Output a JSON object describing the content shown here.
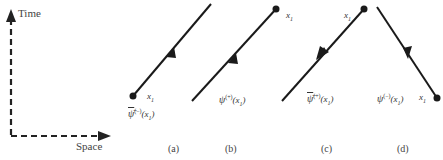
{
  "axes": {
    "time_label": "Time",
    "space_label": "Space",
    "style": "dashed"
  },
  "panels": [
    {
      "id": "a",
      "caption": "(a)",
      "point_label": "x1",
      "field_symbol": "ψ̄",
      "field_superscript": "(−)",
      "field_argument": "(x1)",
      "direction": "up-right",
      "arrow": "forward",
      "dot_position": "bottom"
    },
    {
      "id": "b",
      "caption": "(b)",
      "point_label": "x1",
      "field_symbol": "ψ",
      "field_superscript": "(+)",
      "field_argument": "(x1)",
      "direction": "up-right",
      "arrow": "forward",
      "dot_position": "top"
    },
    {
      "id": "c",
      "caption": "(c)",
      "point_label": "x1",
      "field_symbol": "ψ̄",
      "field_superscript": "(+)",
      "field_argument": "(x1)",
      "direction": "down-left",
      "arrow": "backward",
      "dot_position": "top"
    },
    {
      "id": "d",
      "caption": "(d)",
      "point_label": "x1",
      "field_symbol": "ψ",
      "field_superscript": "(−)",
      "field_argument": "(x1)",
      "direction": "down-right",
      "arrow": "forward",
      "dot_position": "bottom"
    }
  ],
  "colors": {
    "line": "#1a1a1a",
    "text": "#333333"
  }
}
